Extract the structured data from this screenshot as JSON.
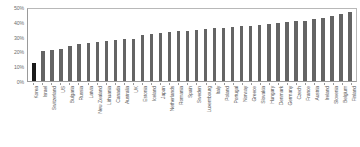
{
  "chart_data": {
    "type": "bar",
    "title": "",
    "xlabel": "",
    "ylabel": "",
    "ylim": [
      0,
      50
    ],
    "ytick_labels": [
      "50%",
      "40%",
      "30%",
      "20%",
      "10%",
      "0%"
    ],
    "ytick_values": [
      50,
      40,
      30,
      20,
      10,
      0
    ],
    "grid": false,
    "legend": null,
    "highlight_category": "Korea",
    "highlight_color": "#1a1a1a",
    "bar_color": "#646464",
    "categories": [
      "Korea",
      "Israel",
      "Switzerland",
      "US",
      "Bulgaria",
      "Russia",
      "Latvia",
      "New Zealand",
      "Lithuania",
      "Canada",
      "Australia",
      "UK",
      "Estonia",
      "Iceland",
      "Japan",
      "Netherlands",
      "Romania",
      "Spain",
      "Sweden",
      "Luxembourg",
      "Italy",
      "Poland",
      "Portugal",
      "Norway",
      "Greece",
      "Slovakia",
      "Hungary",
      "Denmark",
      "Germany",
      "Czech",
      "France",
      "Austria",
      "Ireland",
      "Slovenia",
      "Belgium",
      "Finland"
    ],
    "values": [
      12.5,
      21.0,
      21.5,
      22.0,
      24.5,
      26.0,
      26.5,
      27.0,
      27.5,
      28.5,
      29.0,
      29.5,
      32.0,
      32.5,
      33.5,
      34.0,
      34.5,
      35.0,
      35.5,
      36.0,
      36.5,
      37.0,
      37.5,
      38.0,
      38.5,
      39.0,
      39.5,
      40.0,
      41.0,
      41.5,
      42.0,
      43.0,
      44.0,
      45.0,
      46.5,
      48.0
    ]
  }
}
